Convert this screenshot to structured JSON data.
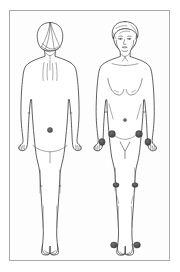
{
  "panel": {
    "title": "Anatomical body map",
    "subject_sex": "female",
    "view_count": 2,
    "background_color": "#fdfdfd",
    "frame_color": "#a8a8a8",
    "outline_color": "#2b2b2b",
    "detail_color": "#5a5a5a",
    "lesion_color": "#4a4a4a",
    "skin_fill": "#ffffff"
  },
  "views": [
    {
      "id": "posterior",
      "label": "Posterior view",
      "position": "left",
      "center_x": 50,
      "hair_style": "long hair gathered back",
      "face_visible": false,
      "markers": [
        {
          "name": "lower-back-marker",
          "region": "lower back",
          "cx": 50,
          "cy": 130,
          "r": 2.6,
          "shape": "dot"
        },
        {
          "name": "left-elbow-marker",
          "region": "left elbow",
          "cx": 29,
          "cy": 113,
          "r": 1.1,
          "shape": "tick"
        },
        {
          "name": "right-elbow-marker",
          "region": "right elbow",
          "cx": 71,
          "cy": 113,
          "r": 1.1,
          "shape": "tick"
        },
        {
          "name": "left-knee-marker",
          "region": "left knee",
          "cx": 41,
          "cy": 186,
          "r": 1.2,
          "shape": "tick"
        },
        {
          "name": "right-knee-marker",
          "region": "right knee",
          "cx": 60,
          "cy": 186,
          "r": 1.2,
          "shape": "tick"
        }
      ]
    },
    {
      "id": "anterior",
      "label": "Anterior view",
      "position": "right",
      "center_x": 125,
      "hair_style": "short cropped hair",
      "face_visible": true,
      "markers": [
        {
          "name": "navel-marker",
          "region": "navel",
          "cx": 125,
          "cy": 120,
          "r": 1.6,
          "shape": "dot"
        },
        {
          "name": "left-hip-lesion",
          "region": "left hip",
          "cx": 112,
          "cy": 134,
          "r": 3.4,
          "shape": "patch"
        },
        {
          "name": "right-hip-lesion",
          "region": "right hip",
          "cx": 139,
          "cy": 134,
          "r": 3.4,
          "shape": "patch"
        },
        {
          "name": "left-hand-lesion",
          "region": "left hand",
          "cx": 102,
          "cy": 142,
          "r": 3.2,
          "shape": "patch"
        },
        {
          "name": "right-hand-lesion",
          "region": "right hand",
          "cx": 148,
          "cy": 142,
          "r": 3.2,
          "shape": "patch"
        },
        {
          "name": "left-elbow-marker-front",
          "region": "left elbow",
          "cx": 106,
          "cy": 112,
          "r": 1.1,
          "shape": "tick"
        },
        {
          "name": "right-elbow-marker-front",
          "region": "right elbow",
          "cx": 144,
          "cy": 112,
          "r": 1.1,
          "shape": "tick"
        },
        {
          "name": "left-knee-lesion",
          "region": "left knee",
          "cx": 116,
          "cy": 185,
          "r": 3.0,
          "shape": "patch"
        },
        {
          "name": "right-knee-lesion",
          "region": "right knee",
          "cx": 135,
          "cy": 185,
          "r": 3.0,
          "shape": "patch"
        },
        {
          "name": "left-foot-lesion",
          "region": "left foot",
          "cx": 114,
          "cy": 245,
          "r": 3.2,
          "shape": "patch"
        },
        {
          "name": "right-foot-lesion",
          "region": "right foot",
          "cx": 137,
          "cy": 245,
          "r": 3.2,
          "shape": "patch"
        }
      ]
    }
  ]
}
